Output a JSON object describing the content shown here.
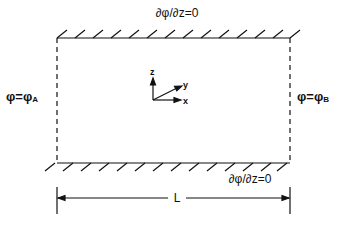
{
  "diagram": {
    "type": "boundary-value-problem-domain",
    "colors": {
      "ink": "#111111",
      "background": "#ffffff"
    },
    "box": {
      "left": 57,
      "top": 38,
      "right": 290,
      "bottom": 163
    },
    "boundaries": {
      "top": {
        "label": "∂φ/∂z=0",
        "style": "hatched-wall"
      },
      "bottom": {
        "label": "∂φ/∂z=0",
        "style": "hatched-wall"
      },
      "left": {
        "label_main": "φ=φ",
        "label_sub": "A",
        "style": "dashed"
      },
      "right": {
        "label_main": "φ=φ",
        "label_sub": "B",
        "style": "dashed"
      }
    },
    "axes": {
      "z": "z",
      "y": "y",
      "x": "x"
    },
    "dimension": {
      "label": "L"
    }
  }
}
